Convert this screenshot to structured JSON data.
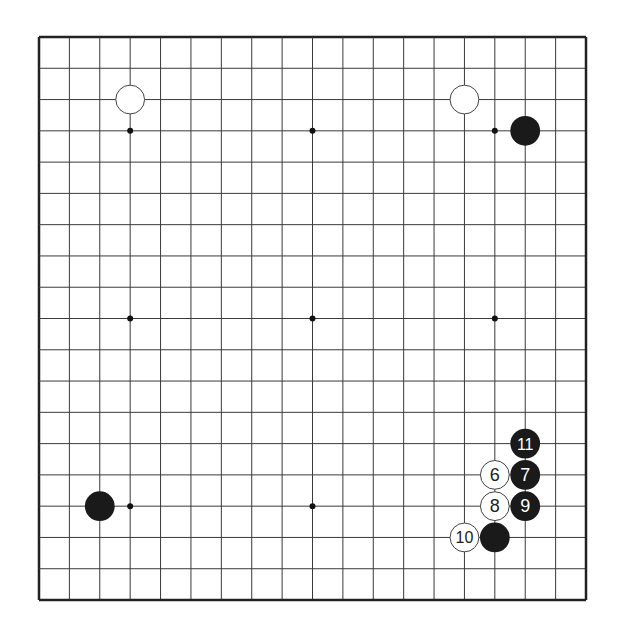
{
  "board": {
    "size": 19,
    "origin": {
      "x": 39,
      "y": 37
    },
    "extent": {
      "x": 586,
      "y": 600
    },
    "line_color": "#3a3a3a",
    "border_color": "#222222",
    "star_points": [
      [
        4,
        4
      ],
      [
        10,
        4
      ],
      [
        16,
        4
      ],
      [
        4,
        10
      ],
      [
        10,
        10
      ],
      [
        16,
        10
      ],
      [
        4,
        16
      ],
      [
        10,
        16
      ],
      [
        16,
        16
      ]
    ]
  },
  "stones": [
    {
      "color": "white",
      "col": 4,
      "row": 3,
      "label": ""
    },
    {
      "color": "white",
      "col": 15,
      "row": 3,
      "label": ""
    },
    {
      "color": "black",
      "col": 17,
      "row": 4,
      "label": ""
    },
    {
      "color": "black",
      "col": 3,
      "row": 16,
      "label": ""
    },
    {
      "color": "black",
      "col": 17,
      "row": 14,
      "label": "11"
    },
    {
      "color": "white",
      "col": 16,
      "row": 15,
      "label": "6"
    },
    {
      "color": "black",
      "col": 17,
      "row": 15,
      "label": "7"
    },
    {
      "color": "white",
      "col": 16,
      "row": 16,
      "label": "8"
    },
    {
      "color": "black",
      "col": 17,
      "row": 16,
      "label": "9"
    },
    {
      "color": "white",
      "col": 15,
      "row": 17,
      "label": "10"
    },
    {
      "color": "black",
      "col": 16,
      "row": 17,
      "label": ""
    }
  ],
  "colors": {
    "black_stone": "#1a1a1a",
    "white_stone": "#ffffff",
    "white_outline": "#444444"
  }
}
